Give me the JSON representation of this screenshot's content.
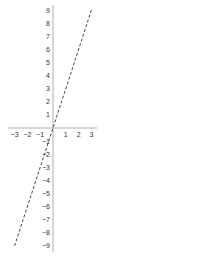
{
  "chart_data": {
    "type": "line",
    "title": "",
    "xlabel": "",
    "ylabel": "",
    "xlim": [
      -3,
      3
    ],
    "ylim": [
      -9,
      9
    ],
    "grid": false,
    "legend": null,
    "x_ticks": [
      -3,
      -2,
      -1,
      1,
      2,
      3
    ],
    "x_tick_labels": [
      "−3",
      "−2",
      "−1",
      "1",
      "2",
      "3"
    ],
    "y_ticks": [
      9,
      8,
      7,
      6,
      5,
      4,
      3,
      2,
      1,
      -1,
      -2,
      -3,
      -4,
      -5,
      -6,
      -7,
      -8,
      -9
    ],
    "y_tick_labels": [
      "9",
      "8",
      "7",
      "6",
      "5",
      "4",
      "3",
      "2",
      "1",
      "−1",
      "−2",
      "−3",
      "−4",
      "−5",
      "−6",
      "−7",
      "−8",
      "−9"
    ],
    "series": [
      {
        "name": "y = 3x",
        "style": "dashed",
        "color": "#333333",
        "x": [
          -3,
          3
        ],
        "y": [
          -9,
          9
        ]
      }
    ]
  },
  "colors": {
    "axis": "#999999",
    "line": "#333333",
    "text": "#333333",
    "background": "#ffffff"
  }
}
